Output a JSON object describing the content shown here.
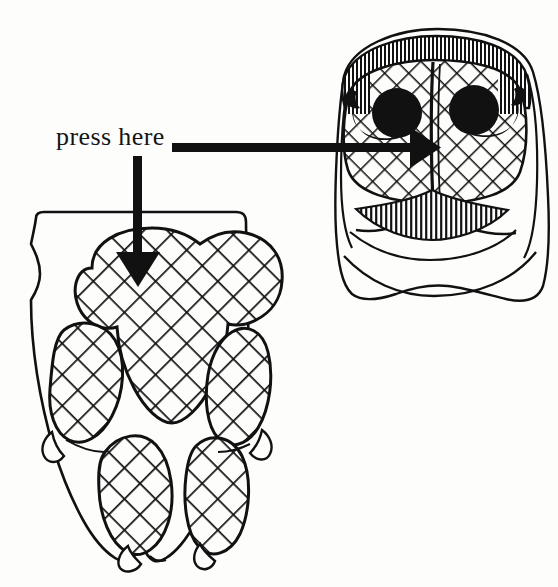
{
  "figure": {
    "type": "anatomical-line-drawing",
    "medium": "scanned ink illustration",
    "background_color": "#fdfdfc",
    "ink_color": "#111111",
    "annotation": {
      "label_text": "press here",
      "label_font_style": "serif",
      "arrows": [
        {
          "name": "arrow-to-muzzle",
          "direction": "right",
          "from_x": 172,
          "from_y": 150,
          "to_x": 441,
          "to_y": 148,
          "target": "upper-figure-muzzle-nostril-region"
        },
        {
          "name": "arrow-to-paw-pad",
          "direction": "down",
          "from_x": 138,
          "from_y": 156,
          "to_x": 138,
          "to_y": 287,
          "target": "lower-figure-central-metacarpal-pad"
        }
      ]
    },
    "panels": [
      {
        "name": "upper-figure",
        "label": "muzzle / nose pad, frontal view",
        "position": "top-right",
        "bounds": {
          "x": 318,
          "y": 26,
          "width": 230,
          "height": 280
        },
        "regions": [
          {
            "name": "upper-hatch-band",
            "fill": "vertical-hatch"
          },
          {
            "name": "nose-pad-crosshatch",
            "fill": "cross-hatch"
          },
          {
            "name": "left-nostril",
            "fill": "solid-black"
          },
          {
            "name": "right-nostril",
            "fill": "solid-black"
          },
          {
            "name": "philtrum-groove",
            "fill": "outline"
          },
          {
            "name": "lower-lip-band",
            "fill": "vertical-hatch"
          },
          {
            "name": "chin-outline",
            "fill": "outline"
          }
        ]
      },
      {
        "name": "lower-figure",
        "label": "paw, plantar view",
        "position": "bottom-left",
        "bounds": {
          "x": 30,
          "y": 210,
          "width": 218,
          "height": 355
        },
        "regions": [
          {
            "name": "paw-outline",
            "fill": "outline"
          },
          {
            "name": "central-pad",
            "fill": "cross-hatch"
          },
          {
            "name": "toe-pad-outer-left",
            "fill": "cross-hatch"
          },
          {
            "name": "toe-pad-outer-right",
            "fill": "cross-hatch"
          },
          {
            "name": "toe-pad-inner-left",
            "fill": "cross-hatch"
          },
          {
            "name": "toe-pad-inner-right",
            "fill": "cross-hatch"
          }
        ]
      }
    ]
  }
}
